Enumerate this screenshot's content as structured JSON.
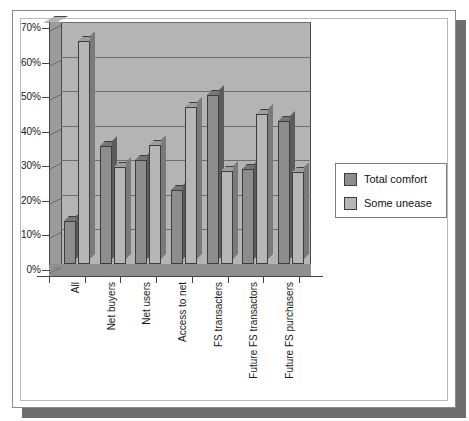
{
  "chart_data": {
    "type": "bar",
    "title": "",
    "xlabel": "",
    "ylabel": "",
    "ylim": [
      0,
      70
    ],
    "ytick_labels": [
      "70%",
      "60%",
      "50%",
      "40%",
      "30%",
      "20%",
      "10%",
      "0%"
    ],
    "ytick_values": [
      70,
      60,
      50,
      40,
      30,
      20,
      10,
      0
    ],
    "grid": true,
    "legend_position": "right",
    "style": "3d-clustered-column",
    "categories": [
      "All",
      "Net buyers",
      "Net users",
      "Access to net",
      "FS transacters",
      "Future FS transactors",
      "Future FS purchasers"
    ],
    "series": [
      {
        "name": "Total comfort",
        "color": "#8d8d8d",
        "values": [
          12.5,
          34,
          30,
          21.5,
          49,
          27.5,
          41.5
        ]
      },
      {
        "name": "Some unease",
        "color": "#b6b6b6",
        "values": [
          64.5,
          28,
          34.5,
          45.5,
          27,
          43.5,
          26.5
        ]
      }
    ]
  },
  "legend": {
    "items": [
      {
        "label": "Total comfort",
        "color": "#8d8d8d"
      },
      {
        "label": "Some unease",
        "color": "#b6b6b6"
      }
    ]
  },
  "colors": {
    "plot_background": "#b4b4b4",
    "page_background": "#ffffff",
    "shadow": "#6e6e6e",
    "gridline": "#6d6d6d",
    "axis": "#444444",
    "series_total_comfort": "#8d8d8d",
    "series_some_unease": "#b6b6b6"
  }
}
